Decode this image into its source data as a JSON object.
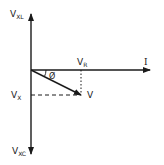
{
  "diagram": {
    "type": "phasor-diagram",
    "labels": {
      "vxl_main": "V",
      "vxl_sub": "XL",
      "vr_main": "V",
      "vr_sub": "R",
      "current": "I",
      "phase_angle": "Ø",
      "voltage": "V",
      "vx_main": "V",
      "vx_sub": "X",
      "vxc_main": "V",
      "vxc_sub": "XC"
    },
    "colors": {
      "line": "#1a1a1a",
      "background": "#ffffff"
    }
  }
}
